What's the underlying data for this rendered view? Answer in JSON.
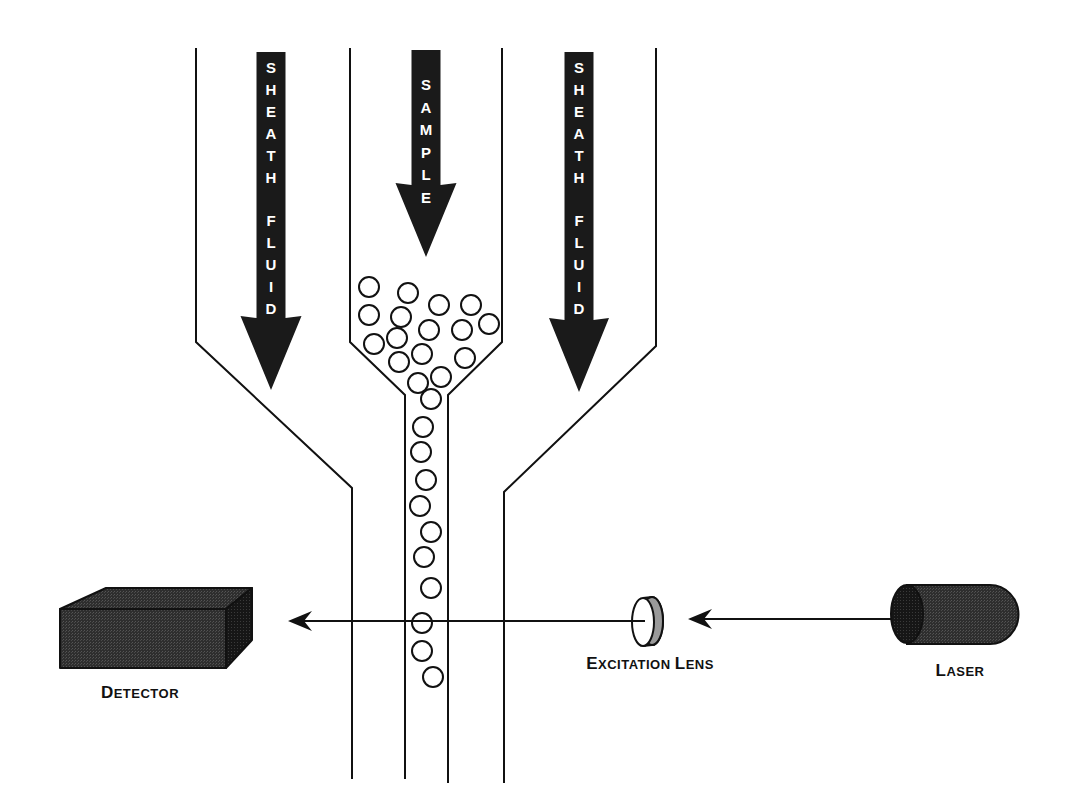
{
  "colors": {
    "background": "#ffffff",
    "line": "#111111",
    "arrow_fill": "#1a1a1a",
    "arrow_text": "#ffffff",
    "device_fill": "#3a3a3a"
  },
  "arrows": [
    {
      "id": "sheath-left",
      "text": "SHEATH FLUID",
      "letters": [
        "S",
        "H",
        "E",
        "A",
        "T",
        "H",
        "",
        "F",
        "L",
        "U",
        "I",
        "D"
      ],
      "x": 271,
      "top": 52,
      "head_y": 318,
      "tip_y": 390,
      "shaft_w": 29,
      "head_w": 61
    },
    {
      "id": "sample",
      "text": "SAMPLE",
      "letters": [
        "S",
        "A",
        "M",
        "P",
        "L",
        "E"
      ],
      "x": 426,
      "top": 50,
      "head_y": 185,
      "tip_y": 257,
      "shaft_w": 29,
      "head_w": 61
    },
    {
      "id": "sheath-right",
      "text": "SHEATH FLUID",
      "letters": [
        "S",
        "H",
        "E",
        "A",
        "T",
        "H",
        "",
        "F",
        "L",
        "U",
        "I",
        "D"
      ],
      "x": 579,
      "top": 52,
      "head_y": 320,
      "tip_y": 392,
      "shaft_w": 29,
      "head_w": 60
    }
  ],
  "labels": {
    "detector": {
      "first": "D",
      "rest": "ETECTOR",
      "x": 140,
      "y": 683
    },
    "excitation_lens": {
      "first": "E",
      "rest": "XCITATION ",
      "first2": "L",
      "rest2": "ENS",
      "x": 650,
      "y": 654
    },
    "laser": {
      "first": "L",
      "rest": "ASER",
      "x": 960,
      "y": 661
    }
  },
  "particles": [
    [
      369,
      287
    ],
    [
      408,
      293
    ],
    [
      439,
      305
    ],
    [
      471,
      305
    ],
    [
      369,
      315
    ],
    [
      401,
      317
    ],
    [
      429,
      330
    ],
    [
      462,
      330
    ],
    [
      489,
      324
    ],
    [
      374,
      344
    ],
    [
      397,
      338
    ],
    [
      422,
      354
    ],
    [
      465,
      358
    ],
    [
      399,
      362
    ],
    [
      441,
      377
    ],
    [
      418,
      383
    ],
    [
      431,
      399
    ],
    [
      423,
      427
    ],
    [
      421,
      452
    ],
    [
      426,
      480
    ],
    [
      420,
      506
    ],
    [
      431,
      532
    ],
    [
      424,
      557
    ],
    [
      431,
      588
    ],
    [
      422,
      623
    ],
    [
      422,
      651
    ],
    [
      433,
      677
    ]
  ],
  "particle_radius": 10,
  "beam": {
    "y": 621,
    "laser_to_lens_from": 891,
    "laser_to_lens_tip": 688,
    "lens_to_detector_from": 645,
    "lens_to_detector_tip": 288
  }
}
